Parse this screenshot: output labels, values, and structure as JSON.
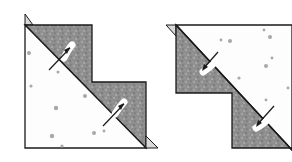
{
  "figure": {
    "description": "Two quilt half-square triangle units sewn in a stepped arrangement, showing pressing direction arrows",
    "colors": {
      "background": "#ffffff",
      "dark_fabric": "#8e8e8e",
      "light_fabric": "#fdfdfd",
      "outline": "#1a1a1a",
      "print_motif": "#a8a8a8",
      "dogear": "#d9d9d9"
    },
    "panels": [
      {
        "id": "left",
        "label": "",
        "arrows": 2,
        "arrow_direction": "toward dark fabric (up-right)"
      },
      {
        "id": "right",
        "label": "",
        "arrows": 2,
        "arrow_direction": "toward dark fabric (down-left)"
      }
    ]
  }
}
